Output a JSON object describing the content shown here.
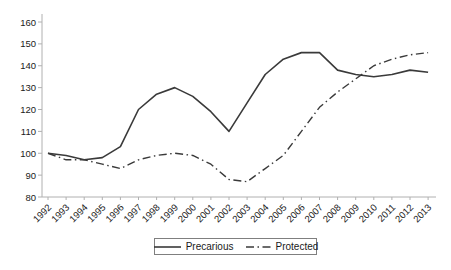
{
  "chart_data": {
    "type": "line",
    "title": "",
    "xlabel": "",
    "ylabel": "",
    "x": [
      1992,
      1993,
      1994,
      1995,
      1996,
      1997,
      1998,
      1999,
      2000,
      2001,
      2002,
      2003,
      2004,
      2005,
      2006,
      2007,
      2008,
      2009,
      2010,
      2011,
      2012,
      2013
    ],
    "series": [
      {
        "name": "Precarious",
        "line_style": "solid",
        "values": [
          100,
          99,
          97,
          98,
          103,
          120,
          127,
          130,
          126,
          119,
          110,
          123,
          136,
          143,
          146,
          146,
          138,
          136,
          135,
          136,
          138,
          137
        ]
      },
      {
        "name": "Protected",
        "line_style": "dashdot",
        "values": [
          100,
          97,
          97,
          95,
          93,
          97,
          99,
          100,
          99,
          95,
          88,
          87,
          93,
          99,
          110,
          121,
          128,
          134,
          140,
          143,
          145,
          146
        ]
      }
    ],
    "ylim": [
      80,
      160
    ],
    "yticks": [
      80,
      90,
      100,
      110,
      120,
      130,
      140,
      150,
      160
    ],
    "grid": false,
    "legend_position": "bottom-center",
    "colors": {
      "line": "#3a3a3a",
      "axis": "#b0b0b0",
      "text": "#1a1a1a",
      "background": "#ffffff"
    }
  }
}
